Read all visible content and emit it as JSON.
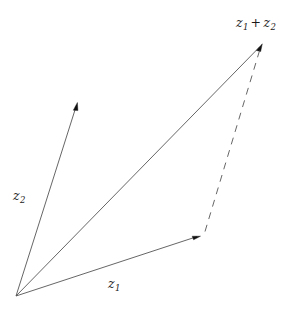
{
  "figure": {
    "kind": "vector-addition-diagram",
    "background_color": "#ffffff",
    "line_color": "#555555",
    "arrowhead_color": "#111111",
    "width": 301,
    "height": 318,
    "origin": {
      "x": 16,
      "y": 296
    }
  },
  "labels": {
    "sum": {
      "var1": "z",
      "sub1": "1",
      "operator": "+",
      "var2": "z",
      "sub2": "2",
      "plain": "z1 + z2"
    },
    "z1": {
      "var": "z",
      "sub": "1",
      "plain": "z1"
    },
    "z2": {
      "var": "z",
      "sub": "2",
      "plain": "z2"
    }
  },
  "vectors": [
    {
      "name": "z1",
      "style": "solid",
      "from": {
        "x": 16,
        "y": 296
      },
      "to": {
        "x": 199,
        "y": 236
      },
      "arrowhead": true
    },
    {
      "name": "z2",
      "style": "solid",
      "from": {
        "x": 16,
        "y": 296
      },
      "to": {
        "x": 77,
        "y": 103
      },
      "arrowhead": true
    },
    {
      "name": "z1-plus-z2",
      "style": "solid",
      "from": {
        "x": 16,
        "y": 296
      },
      "to": {
        "x": 262,
        "y": 44
      },
      "arrowhead": true
    },
    {
      "name": "parallelogram-side",
      "style": "dashed",
      "from": {
        "x": 205,
        "y": 231
      },
      "to": {
        "x": 260,
        "y": 48
      },
      "arrowhead": false
    }
  ]
}
